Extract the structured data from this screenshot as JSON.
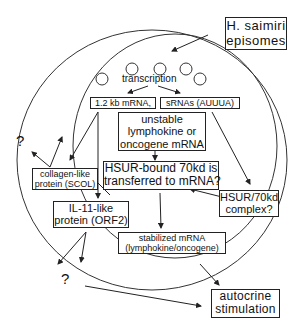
{
  "diagram": {
    "episomes_label": [
      "H. saimiri",
      "episomes"
    ],
    "transcription_label": "transcription",
    "mrna_label": "1.2 kb mRNA,",
    "srnas_label": "sRNAs (AUUUA)",
    "unstable_label": [
      "unstable",
      "lymphokine or",
      "oncogene mRNA"
    ],
    "hsur_bound_label": [
      "HSUR-bound 70kd is",
      "transferred to mRNA?"
    ],
    "collagen_label": [
      "collagen-like",
      "protein (SCOL)"
    ],
    "il11_label": [
      "IL-11-like",
      "protein (ORF2)"
    ],
    "hsur_complex_label": [
      "HSUR/70kd",
      "complex?"
    ],
    "stabilized_label": [
      "stabilized mRNA",
      "(lymphokine/oncogene)"
    ],
    "autocrine_label": [
      "autocrine",
      "stimulation"
    ],
    "question_top": "?",
    "question_bottom": "?"
  }
}
